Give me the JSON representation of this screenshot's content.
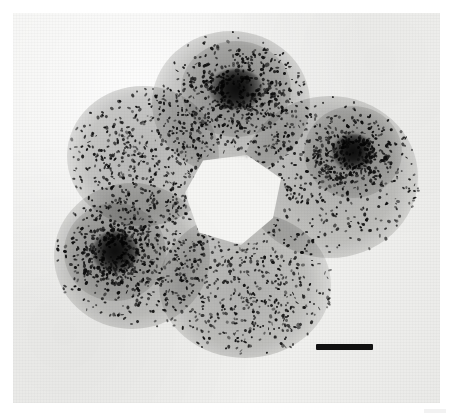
{
  "figure": {
    "kind": "micrograph",
    "caption_text": "",
    "panel": {
      "left": 13,
      "top": 13,
      "width": 427,
      "height": 390
    },
    "background_color": "#ffffff",
    "panel_color": "#f0f0ee"
  },
  "specimen": {
    "description": "autoradiograph of a cell rosette",
    "cell_count": 5,
    "stain_color": "#6e6e6c",
    "grain_color": "#141414",
    "lumen": {
      "cx": 235,
      "cy": 200,
      "rx": 50,
      "ry": 45,
      "color": "#f6f6f4"
    },
    "cells": [
      {
        "name": "cell-top",
        "cx": 231,
        "cy": 103,
        "rx": 79,
        "ry": 72
      },
      {
        "name": "cell-upper-left",
        "cx": 143,
        "cy": 156,
        "rx": 76,
        "ry": 70
      },
      {
        "name": "cell-lower-left",
        "cx": 132,
        "cy": 256,
        "rx": 78,
        "ry": 73
      },
      {
        "name": "cell-bottom",
        "cx": 245,
        "cy": 285,
        "rx": 86,
        "ry": 73
      },
      {
        "name": "cell-right",
        "cx": 330,
        "cy": 177,
        "rx": 88,
        "ry": 81
      }
    ],
    "nucleoli": [
      {
        "name": "nucleolus-top",
        "cx": 236,
        "cy": 89,
        "rx": 27,
        "ry": 20
      },
      {
        "name": "nucleolus-lower-left",
        "cx": 115,
        "cy": 252,
        "rx": 23,
        "ry": 21
      },
      {
        "name": "nucleolus-right",
        "cx": 353,
        "cy": 152,
        "rx": 21,
        "ry": 18
      }
    ]
  },
  "scale_bar": {
    "label": "",
    "left": 316,
    "top": 344,
    "width": 57,
    "height": 6,
    "color": "#111111"
  }
}
